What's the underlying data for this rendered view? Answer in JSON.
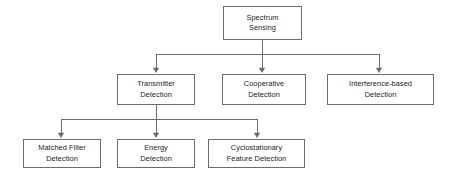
{
  "diagram": {
    "colors": {
      "background": "#ffffff",
      "box_border": "#6b6b6b",
      "connector": "#6b6b6b",
      "text": "#1a1a1a"
    },
    "levels": [
      {
        "level": 1,
        "nodes": [
          {
            "id": "spectrum-sensing",
            "line1": "Spectrum",
            "line2": "Sensing",
            "x": 223,
            "y": 6,
            "w": 79,
            "h": 34
          }
        ]
      },
      {
        "level": 2,
        "nodes": [
          {
            "id": "transmitter-detection",
            "line1": "Transmitter",
            "line2": "Detection",
            "x": 117,
            "y": 74,
            "w": 78,
            "h": 31
          },
          {
            "id": "cooperative-detection",
            "line1": "Cooperative",
            "line2": "Detection",
            "x": 222,
            "y": 74,
            "w": 84,
            "h": 31
          },
          {
            "id": "interference-based-detection",
            "line1": "Interference-based",
            "line2": "Detection",
            "x": 327,
            "y": 74,
            "w": 107,
            "h": 31
          }
        ]
      },
      {
        "level": 3,
        "nodes": [
          {
            "id": "matched-filter-detection",
            "line1": "Matched Filter",
            "line2": "Detection",
            "x": 23,
            "y": 139,
            "w": 78,
            "h": 29
          },
          {
            "id": "energy-detection",
            "line1": "Energy",
            "line2": "Detection",
            "x": 117,
            "y": 139,
            "w": 78,
            "h": 29
          },
          {
            "id": "cyclostationary-feature-detection",
            "line1": "Cyclostationary",
            "line2": "Feature Detection",
            "x": 208,
            "y": 139,
            "w": 97,
            "h": 29
          }
        ]
      }
    ],
    "edges": [
      {
        "id": "edge-root-bus",
        "from": "spectrum-sensing",
        "to": [
          "transmitter-detection",
          "cooperative-detection",
          "interference-based-detection"
        ],
        "stem_x": 262,
        "stem_top": 40,
        "bus_y": 54,
        "bus_left": 156,
        "bus_right": 379,
        "arrow_xs": [
          156,
          262,
          379
        ],
        "arrow_tip_y": 73
      },
      {
        "id": "edge-transmitter-bus",
        "from": "transmitter-detection",
        "to": [
          "matched-filter-detection",
          "energy-detection",
          "cyclostationary-feature-detection"
        ],
        "stem_x": 156,
        "stem_top": 105,
        "bus_y": 119,
        "bus_left": 61,
        "bus_right": 257,
        "arrow_xs": [
          61,
          156,
          257
        ],
        "arrow_tip_y": 138
      }
    ]
  }
}
